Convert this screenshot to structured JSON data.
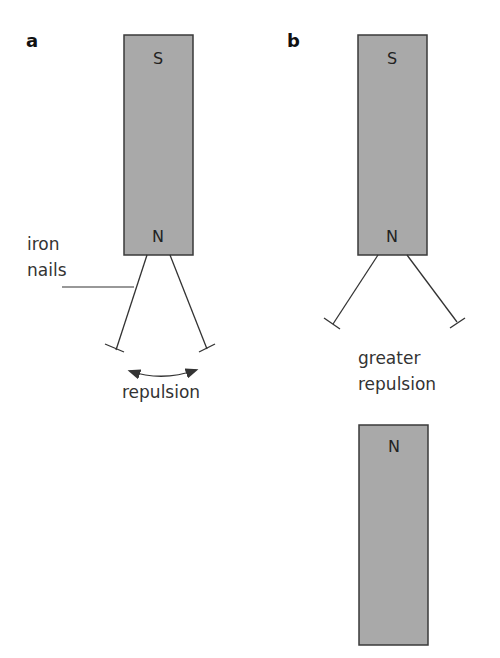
{
  "figure": {
    "cut_off_title": "(Figure caption partially cut off)",
    "colors": {
      "magnet_fill": "#a9a9a9",
      "magnet_stroke": "#3a3a3a",
      "line": "#333333",
      "text": "#333333"
    },
    "panel_a": {
      "label": "a",
      "magnet": {
        "top_pole": "S",
        "bottom_pole": "N"
      },
      "callout": [
        "iron",
        "nails"
      ],
      "effect_label": "repulsion"
    },
    "panel_b": {
      "label": "b",
      "upper_magnet": {
        "top_pole": "S",
        "bottom_pole": "N"
      },
      "effect_label": [
        "greater",
        "repulsion"
      ],
      "lower_magnet": {
        "top_pole": "N"
      }
    }
  }
}
